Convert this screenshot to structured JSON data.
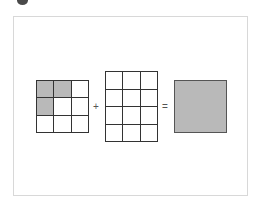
{
  "diagram": {
    "left_grid": {
      "rows": 3,
      "cols": 3,
      "cells": [
        [
          1,
          1,
          0
        ],
        [
          1,
          0,
          0
        ],
        [
          0,
          0,
          0
        ]
      ]
    },
    "operator_plus": "+",
    "middle_grid": {
      "rows": 4,
      "cols": 3,
      "cells": [
        [
          0,
          0,
          0
        ],
        [
          0,
          0,
          0
        ],
        [
          0,
          0,
          0
        ],
        [
          0,
          0,
          0
        ]
      ]
    },
    "operator_equals": "=",
    "result": {
      "shape": "filled-square",
      "fill_color": "#b9b9b9"
    },
    "colors": {
      "fill": "#b9b9b9",
      "line": "#333333",
      "frame": "#d8d8d8"
    }
  }
}
